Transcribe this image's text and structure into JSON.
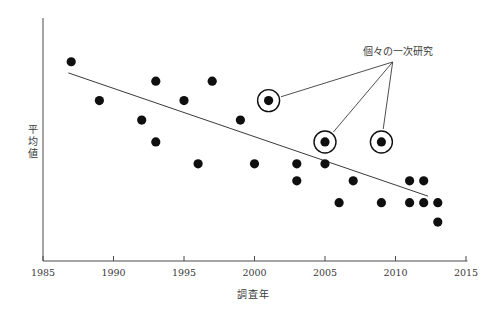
{
  "chart_data": {
    "type": "scatter",
    "title": "",
    "xlabel": "調査年",
    "ylabel": "平均値",
    "xlim": [
      1985,
      2015
    ],
    "ylim": [
      0,
      100
    ],
    "x_ticks": [
      1985,
      1990,
      1995,
      2000,
      2005,
      2010,
      2015
    ],
    "y_ticks": [],
    "grid": false,
    "legend": false,
    "points": [
      {
        "year": 1987,
        "value": 82,
        "circled": false
      },
      {
        "year": 1989,
        "value": 66,
        "circled": false
      },
      {
        "year": 1992,
        "value": 58,
        "circled": false
      },
      {
        "year": 1993,
        "value": 74,
        "circled": false
      },
      {
        "year": 1993,
        "value": 49,
        "circled": false
      },
      {
        "year": 1995,
        "value": 66,
        "circled": false
      },
      {
        "year": 1996,
        "value": 40,
        "circled": false
      },
      {
        "year": 1997,
        "value": 74,
        "circled": false
      },
      {
        "year": 1999,
        "value": 58,
        "circled": false
      },
      {
        "year": 2000,
        "value": 40,
        "circled": false
      },
      {
        "year": 2001,
        "value": 66,
        "circled": true
      },
      {
        "year": 2003,
        "value": 40,
        "circled": false
      },
      {
        "year": 2003,
        "value": 33,
        "circled": false
      },
      {
        "year": 2005,
        "value": 40,
        "circled": false
      },
      {
        "year": 2005,
        "value": 49,
        "circled": true
      },
      {
        "year": 2006,
        "value": 24,
        "circled": false
      },
      {
        "year": 2007,
        "value": 33,
        "circled": false
      },
      {
        "year": 2009,
        "value": 49,
        "circled": true
      },
      {
        "year": 2009,
        "value": 24,
        "circled": false
      },
      {
        "year": 2011,
        "value": 33,
        "circled": false
      },
      {
        "year": 2011,
        "value": 24,
        "circled": false
      },
      {
        "year": 2012,
        "value": 33,
        "circled": false
      },
      {
        "year": 2012,
        "value": 24,
        "circled": false
      },
      {
        "year": 2013,
        "value": 24,
        "circled": false
      },
      {
        "year": 2013,
        "value": 16,
        "circled": false
      }
    ],
    "trend_line": {
      "x1": 1986.8,
      "y1": 77.4,
      "x2": 2012.3,
      "y2": 26.7
    },
    "annotation": {
      "label": "個々の一次研究",
      "label_pos": {
        "year": 2010.2,
        "value": 87.2
      },
      "anchor": {
        "year": 2009.8,
        "value": 81.9
      },
      "target_points": [
        {
          "year": 2001,
          "value": 66
        },
        {
          "year": 2005,
          "value": 49
        },
        {
          "year": 2009,
          "value": 49
        }
      ]
    },
    "colors": {
      "point": "#0f0f0f",
      "axis": "#4a4a4a",
      "trend_line": "#3a3a3a",
      "annotation_line": "#3a3a3a",
      "text": "#3a3a3a"
    }
  }
}
